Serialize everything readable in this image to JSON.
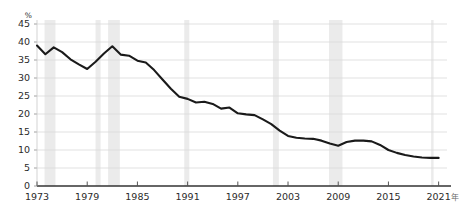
{
  "chart_data": {
    "type": "line",
    "title": "",
    "subtitle": "",
    "xlabel": "",
    "ylabel": "%",
    "x_unit_suffix": "年",
    "xlim": [
      1973,
      2022
    ],
    "ylim": [
      0,
      45
    ],
    "ytick_step": 5,
    "yticks": [
      "0",
      "5",
      "10",
      "15",
      "20",
      "25",
      "30",
      "35",
      "40",
      "45"
    ],
    "xticks": [
      "1973",
      "1979",
      "1985",
      "1991",
      "1997",
      "2003",
      "2009",
      "2015",
      "2021"
    ],
    "grid": "horizontal",
    "legend": "none",
    "line_color": "#1a1a1a",
    "grid_color": "#d9d9d9",
    "band_color": "#e8e8e8",
    "axis_color": "#333333",
    "series": [
      {
        "name": "Union membership rate",
        "x": [
          1973,
          1974,
          1975,
          1976,
          1977,
          1978,
          1979,
          1980,
          1981,
          1982,
          1983,
          1984,
          1985,
          1986,
          1987,
          1988,
          1989,
          1990,
          1991,
          1992,
          1993,
          1994,
          1995,
          1996,
          1997,
          1998,
          1999,
          2000,
          2001,
          2002,
          2003,
          2004,
          2005,
          2006,
          2007,
          2008,
          2009,
          2010,
          2011,
          2012,
          2013,
          2014,
          2015,
          2016,
          2017,
          2018,
          2019,
          2020,
          2021
        ],
        "values": [
          39.0,
          36.6,
          38.5,
          37.2,
          35.2,
          33.8,
          32.5,
          34.5,
          36.8,
          38.8,
          36.5,
          36.2,
          34.8,
          34.3,
          32.2,
          29.6,
          27.0,
          24.8,
          24.2,
          23.2,
          23.4,
          22.8,
          21.5,
          21.8,
          20.2,
          19.9,
          19.7,
          18.5,
          17.2,
          15.4,
          13.9,
          13.4,
          13.2,
          13.1,
          12.6,
          11.8,
          11.2,
          12.2,
          12.6,
          12.6,
          12.4,
          11.4,
          10.0,
          9.2,
          8.6,
          8.2,
          7.9,
          7.8,
          7.8
        ]
      }
    ],
    "recession_bands": [
      {
        "start": 1973.9,
        "end": 1975.2
      },
      {
        "start": 1980.0,
        "end": 1980.6
      },
      {
        "start": 1981.5,
        "end": 1982.9
      },
      {
        "start": 1990.6,
        "end": 1991.2
      },
      {
        "start": 2001.2,
        "end": 2001.9
      },
      {
        "start": 2007.9,
        "end": 2009.5
      },
      {
        "start": 2020.1,
        "end": 2020.4
      }
    ]
  }
}
